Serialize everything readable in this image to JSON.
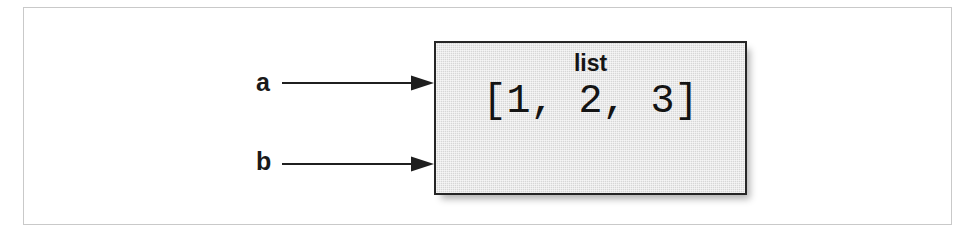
{
  "figure": {
    "kind": "reference-diagram",
    "frame_border_color": "#c9c9c9",
    "background_color": "#ffffff"
  },
  "pointers": [
    {
      "id": "a",
      "label": "a",
      "arrow_icon": "arrow-right-icon",
      "points_to": "list-object"
    },
    {
      "id": "b",
      "label": "b",
      "arrow_icon": "arrow-right-icon",
      "points_to": "list-object"
    }
  ],
  "object": {
    "type_label": "list",
    "value": "[1, 2, 3]",
    "fill_color": "#d6d6d6",
    "border_color": "#262626",
    "text_color": "#141414"
  }
}
